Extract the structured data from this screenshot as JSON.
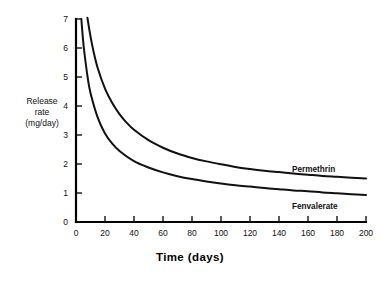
{
  "chart_data": {
    "type": "line",
    "title": "",
    "xlabel": "Time (days)",
    "ylabel": "Release rate (mg/day)",
    "ylabel_lines": [
      "Release",
      "rate",
      "(mg/day)"
    ],
    "xlim": [
      0,
      200
    ],
    "ylim": [
      0,
      7
    ],
    "xticks": [
      0,
      20,
      40,
      60,
      80,
      100,
      120,
      140,
      160,
      180,
      200
    ],
    "yticks": [
      0,
      1,
      2,
      3,
      4,
      5,
      6,
      7
    ],
    "xtick_labels": [
      "0",
      "20",
      "40",
      "60",
      "80",
      "100",
      "120",
      "140",
      "160",
      "180",
      "200"
    ],
    "ytick_labels": [
      "0",
      "1",
      "2",
      "3",
      "4",
      "5",
      "6",
      "7"
    ],
    "grid": false,
    "legend_position": "inline-right-of-curve",
    "line_color": "#111111",
    "series": [
      {
        "name": "Permethrin",
        "label": "Permethrin",
        "x": [
          6,
          8,
          10,
          12,
          15,
          20,
          25,
          30,
          35,
          40,
          50,
          60,
          70,
          80,
          90,
          100,
          110,
          120,
          130,
          140,
          150,
          160,
          170,
          180,
          190,
          200
        ],
        "values": [
          7.6,
          7.0,
          6.4,
          5.9,
          5.3,
          4.6,
          4.1,
          3.72,
          3.42,
          3.18,
          2.82,
          2.56,
          2.36,
          2.21,
          2.09,
          1.99,
          1.9,
          1.83,
          1.77,
          1.72,
          1.67,
          1.63,
          1.59,
          1.56,
          1.53,
          1.5
        ]
      },
      {
        "name": "Fenvalerate",
        "label": "Fenvalerate",
        "x": [
          3,
          4,
          5,
          6,
          8,
          10,
          15,
          20,
          25,
          30,
          40,
          50,
          60,
          70,
          80,
          90,
          100,
          110,
          120,
          130,
          140,
          150,
          160,
          170,
          180,
          190,
          200
        ],
        "values": [
          7.5,
          6.8,
          6.2,
          5.75,
          5.0,
          4.45,
          3.6,
          3.05,
          2.7,
          2.45,
          2.1,
          1.88,
          1.71,
          1.58,
          1.48,
          1.4,
          1.33,
          1.27,
          1.22,
          1.17,
          1.13,
          1.09,
          1.06,
          1.02,
          0.99,
          0.96,
          0.93
        ]
      }
    ]
  },
  "caption": {
    "partial_text": ""
  }
}
